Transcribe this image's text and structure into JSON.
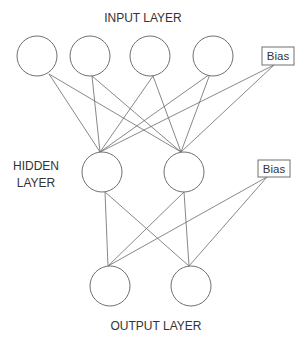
{
  "labels": {
    "input_layer": "INPUT LAYER",
    "hidden_layer_line1": "HIDDEN",
    "hidden_layer_line2": "LAYER",
    "output_layer": "OUTPUT LAYER",
    "input_bias": "Bias",
    "hidden_bias": "Bias"
  },
  "network": {
    "input_nodes": 4,
    "hidden_nodes": 2,
    "output_nodes": 2,
    "has_input_bias": true,
    "has_hidden_bias": true,
    "connectivity": "fully-connected"
  },
  "colors": {
    "stroke": "#707070",
    "text": "#333333",
    "background": "#ffffff"
  }
}
